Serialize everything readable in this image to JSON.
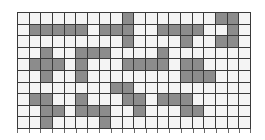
{
  "grid": {
    "rows": 10,
    "cols": 20,
    "colors": {
      "filled": "#8c8c8c",
      "empty": "#f4f4f4",
      "line": "#3a3a3a"
    },
    "cells": [
      "00000000010000000110",
      "01111101110011110010",
      "00000000010000100110",
      "00100111000010000000",
      "01110100011110110000",
      "00100100000000111000",
      "00000000110000000000",
      "01100100011011100000",
      "00110111001000110000",
      "00100001000000000000"
    ]
  }
}
